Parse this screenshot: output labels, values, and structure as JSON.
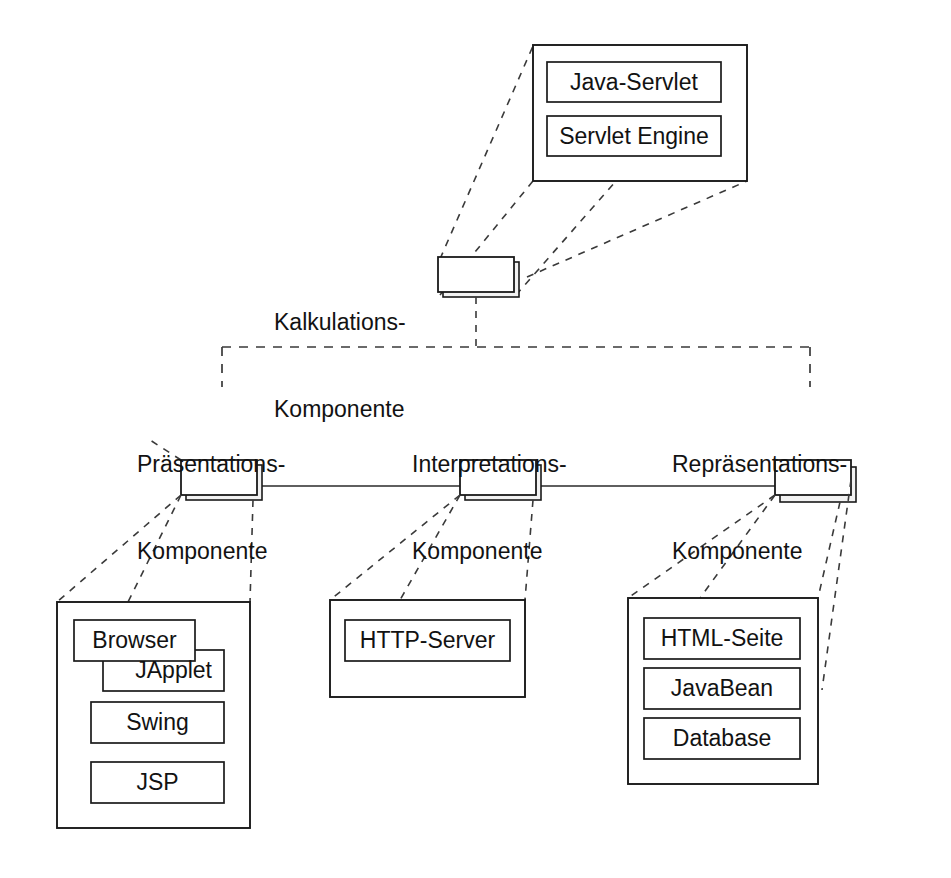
{
  "diagram": {
    "language": "de",
    "notation": "UML component diagram",
    "background_color": "#ffffff",
    "line_color": "#1a1a1a",
    "text_color": "#121212"
  },
  "components": [
    {
      "id": "kalkulations",
      "label_line1": "Kalkulations-",
      "label_line2": "Komponente",
      "detail_items": [
        "Java-Servlet",
        "Servlet Engine"
      ]
    },
    {
      "id": "praesentations",
      "label_line1": "Präsentations-",
      "label_line2": "Komponente",
      "detail_items": [
        "Browser",
        "JApplet",
        "Swing",
        "JSP"
      ]
    },
    {
      "id": "interpretations",
      "label_line1": "Interpretations-",
      "label_line2": "Komponente",
      "detail_items": [
        "HTTP-Server"
      ]
    },
    {
      "id": "repraesentations",
      "label_line1": "Repräsentations-",
      "label_line2": "Komponente",
      "detail_items": [
        "HTML-Seite",
        "JavaBean",
        "Database"
      ]
    }
  ],
  "detail_boxes": {
    "kalkulations": {
      "items": [
        {
          "label": "Java-Servlet"
        },
        {
          "label": "Servlet Engine"
        }
      ]
    },
    "praesentations": {
      "items": [
        {
          "label": "Browser"
        },
        {
          "label": "JApplet"
        },
        {
          "label": "Swing"
        },
        {
          "label": "JSP"
        }
      ]
    },
    "interpretations": {
      "items": [
        {
          "label": "HTTP-Server"
        }
      ]
    },
    "repraesentations": {
      "items": [
        {
          "label": "HTML-Seite"
        },
        {
          "label": "JavaBean"
        },
        {
          "label": "Database"
        }
      ]
    }
  },
  "connectors": {
    "bus_style": "dashed",
    "link_style": "solid",
    "explosion_style": "dashed"
  }
}
